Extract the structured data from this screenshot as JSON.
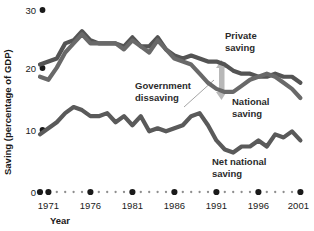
{
  "chart_data": {
    "type": "line",
    "title": "",
    "xlabel": "Year",
    "ylabel": "Saving (percentage of GDP)",
    "ylim": [
      0,
      30
    ],
    "xlim": [
      1970,
      2001
    ],
    "grid": false,
    "legend_position": "inline-annotations",
    "y_ticks": [
      0,
      10,
      20,
      30
    ],
    "y_tick_labels": [
      "0",
      "10",
      "20",
      "30"
    ],
    "x_ticks": [
      1971,
      1976,
      1981,
      1986,
      1991,
      1996,
      2001
    ],
    "x_tick_labels": [
      "1971",
      "1976",
      "1981",
      "1986",
      "1991",
      "1996",
      "2001"
    ],
    "x_minor_ticks": [
      1970,
      1972,
      1973,
      1974,
      1975,
      1977,
      1978,
      1979,
      1980,
      1982,
      1983,
      1984,
      1985,
      1987,
      1988,
      1989,
      1990,
      1992,
      1993,
      1994,
      1995,
      1997,
      1998,
      1999,
      2000
    ],
    "x": [
      1970,
      1971,
      1972,
      1973,
      1974,
      1975,
      1976,
      1977,
      1978,
      1979,
      1980,
      1981,
      1982,
      1983,
      1984,
      1985,
      1986,
      1987,
      1988,
      1989,
      1990,
      1991,
      1992,
      1993,
      1994,
      1995,
      1996,
      1997,
      1998,
      1999,
      2000,
      2001
    ],
    "series": [
      {
        "name": "Private saving",
        "color": "#545454",
        "values": [
          21.0,
          21.5,
          22.0,
          24.5,
          25.0,
          26.5,
          25.0,
          24.5,
          24.5,
          24.5,
          24.0,
          25.5,
          24.0,
          24.0,
          25.5,
          23.5,
          22.5,
          22.0,
          22.5,
          22.0,
          21.5,
          21.5,
          21.0,
          20.0,
          19.5,
          19.5,
          19.0,
          19.0,
          19.5,
          19.0,
          19.0,
          18.0
        ]
      },
      {
        "name": "National saving",
        "color": "#696969",
        "values": [
          19.0,
          18.5,
          20.5,
          23.0,
          24.5,
          26.0,
          24.5,
          24.5,
          24.5,
          24.5,
          23.5,
          25.0,
          24.0,
          23.0,
          25.0,
          23.5,
          22.0,
          21.5,
          21.0,
          19.5,
          18.0,
          17.0,
          16.5,
          16.5,
          17.5,
          18.5,
          19.0,
          19.5,
          19.0,
          18.0,
          17.0,
          15.5
        ]
      },
      {
        "name": "Net national saving",
        "color": "#5a5a5a",
        "values": [
          9.5,
          10.5,
          11.5,
          13.0,
          14.0,
          13.5,
          12.5,
          12.5,
          13.0,
          11.5,
          12.5,
          11.0,
          12.5,
          10.0,
          10.5,
          10.0,
          10.5,
          11.0,
          12.5,
          13.0,
          11.0,
          8.5,
          7.0,
          6.5,
          7.5,
          7.5,
          8.5,
          7.5,
          9.5,
          9.0,
          10.0,
          8.5
        ]
      }
    ],
    "annotations": [
      {
        "name": "private-saving",
        "text_line1": "Private",
        "text_line2": "saving"
      },
      {
        "name": "national-saving",
        "text_line1": "National",
        "text_line2": "saving"
      },
      {
        "name": "government-dissaving",
        "text_line1": "Government",
        "text_line2": "dissaving"
      },
      {
        "name": "net-national-saving",
        "text_line1": "Net national",
        "text_line2": "saving"
      }
    ],
    "gap_arrow": {
      "name": "government-dissaving-gap-arrow",
      "color": "#b8b8b8"
    }
  },
  "colors": {
    "background": "#ffffff",
    "ink": "#1a1a1a",
    "annotation": "#2b2b2b",
    "arrow": "#b8b8b8"
  }
}
